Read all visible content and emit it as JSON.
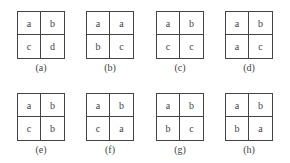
{
  "panels": [
    {
      "label": "(a)",
      "cells": [
        "a",
        "b",
        "c",
        "d"
      ]
    },
    {
      "label": "(b)",
      "cells": [
        "a",
        "a",
        "b",
        "c"
      ]
    },
    {
      "label": "(c)",
      "cells": [
        "a",
        "b",
        "c",
        "c"
      ]
    },
    {
      "label": "(d)",
      "cells": [
        "a",
        "b",
        "a",
        "c"
      ]
    },
    {
      "label": "(e)",
      "cells": [
        "a",
        "b",
        "c",
        "b"
      ]
    },
    {
      "label": "(f)",
      "cells": [
        "a",
        "b",
        "c",
        "a"
      ]
    },
    {
      "label": "(g)",
      "cells": [
        "a",
        "b",
        "b",
        "c"
      ]
    },
    {
      "label": "(h)",
      "cells": [
        "a",
        "b",
        "b",
        "a"
      ]
    }
  ]
}
